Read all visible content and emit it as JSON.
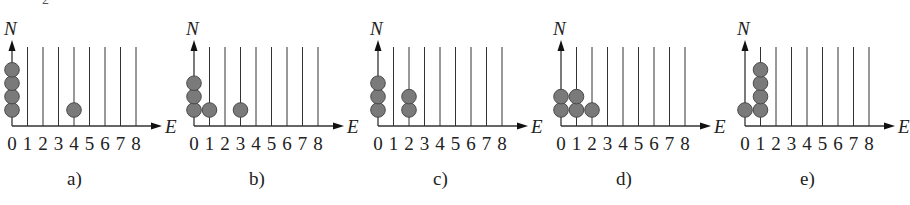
{
  "top_fragment": "2",
  "axis": {
    "y_label": "N",
    "x_label": "E",
    "ticks": [
      "0",
      "1",
      "2",
      "3",
      "4",
      "5",
      "6",
      "7",
      "8"
    ]
  },
  "colors": {
    "ball": "#7a7a7a",
    "ball_edge": "#4a4a4a",
    "line": "#333333"
  },
  "panels": [
    {
      "label": "a)",
      "occupancy": [
        4,
        0,
        0,
        0,
        1,
        0,
        0,
        0,
        0
      ]
    },
    {
      "label": "b)",
      "occupancy": [
        3,
        1,
        0,
        1,
        0,
        0,
        0,
        0,
        0
      ]
    },
    {
      "label": "c)",
      "occupancy": [
        3,
        0,
        2,
        0,
        0,
        0,
        0,
        0,
        0
      ]
    },
    {
      "label": "d)",
      "occupancy": [
        2,
        2,
        1,
        0,
        0,
        0,
        0,
        0,
        0
      ]
    },
    {
      "label": "e)",
      "occupancy": [
        1,
        4,
        0,
        0,
        0,
        0,
        0,
        0,
        0
      ]
    }
  ]
}
